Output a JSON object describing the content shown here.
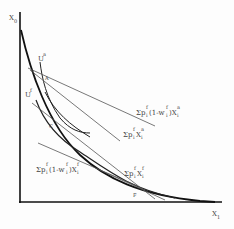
{
  "diagram": {
    "axes": {
      "y_label": "X",
      "y_label_sub": "0",
      "x_label": "X",
      "x_label_sub": "1"
    },
    "curves": {
      "utility_a": {
        "label": "U",
        "sup": "a"
      },
      "utility_f": {
        "label": "U",
        "sup": "f"
      }
    },
    "points": {
      "A": "A",
      "C": "C",
      "F": "F"
    },
    "budget_lines": [
      {
        "id": "pf_1mwf_Xa",
        "prefix": "Σp",
        "sub1": "i",
        "sup1": "f",
        "mid": "(1-w",
        "sub2": "i",
        "sup2": "f",
        "tail": ")X",
        "sub3": "i",
        "sup3": "a"
      },
      {
        "id": "pf_Xa",
        "prefix": "Σp",
        "sub1": "i",
        "sup1": "f",
        "tail": "X",
        "sub3": "i",
        "sup3": "a"
      },
      {
        "id": "pf_Xf",
        "prefix": "Σp",
        "sub1": "i",
        "sup1": "f",
        "tail": "X",
        "sub3": "i",
        "sup3": "f"
      },
      {
        "id": "pf_1mwf_Xf",
        "prefix": "Σp",
        "sub1": "i",
        "sup1": "f",
        "mid": "(1-w",
        "sub2": "i",
        "sup2": "f",
        "tail": ")X",
        "sub3": "i",
        "sup3": "f"
      }
    ],
    "colors": {
      "frontier": "#111111",
      "lines": "#555555",
      "text": "#444444"
    }
  }
}
